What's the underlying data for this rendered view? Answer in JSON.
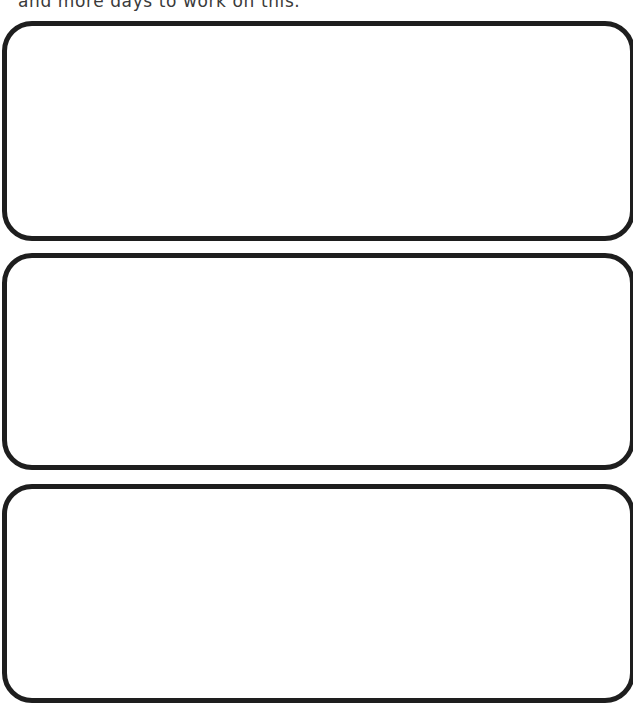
{
  "worksheet": {
    "instruction_text": "and more days to work on this.",
    "boxes": [
      {
        "label": "",
        "content": ""
      },
      {
        "label": "",
        "content": ""
      },
      {
        "label": "",
        "content": ""
      }
    ],
    "colors": {
      "border": "#1e1e1e",
      "text": "#3a3a3a",
      "background": "#ffffff"
    }
  }
}
